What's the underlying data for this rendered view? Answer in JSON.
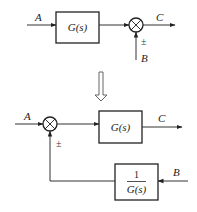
{
  "top_diagram": {
    "input_label": "A",
    "block_label": "G(s)",
    "output_label": "C",
    "disturbance_label": "B",
    "sign_label": "±"
  },
  "transform_arrow": {
    "icon": "hollow-down-arrow"
  },
  "bottom_diagram": {
    "input_label": "A",
    "forward_block_label": "G(s)",
    "output_label": "C",
    "feedback_block_numerator": "1",
    "feedback_block_denominator": "G(s)",
    "disturbance_label": "B",
    "sign_label": "±"
  },
  "colors": {
    "line": "#333333",
    "background": "#ffffff"
  }
}
